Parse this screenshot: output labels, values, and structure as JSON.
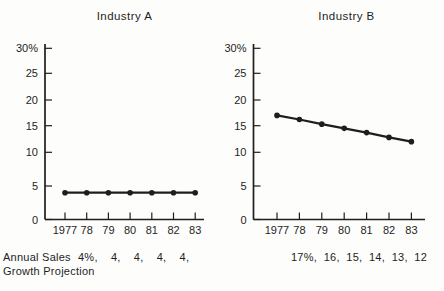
{
  "page": {
    "background": "#fdfdfb",
    "ink": "#1e1e1e"
  },
  "chart_data": [
    {
      "type": "line",
      "title": "Industry A",
      "categories": [
        "1977",
        "78",
        "79",
        "80",
        "81",
        "82",
        "83"
      ],
      "values": [
        4,
        4,
        4,
        4,
        4,
        4,
        4
      ],
      "y_tick_labels": [
        "30%",
        "25",
        "20",
        "15",
        "10",
        "5",
        "0"
      ],
      "y_tick_values": [
        30,
        25,
        20,
        15,
        10,
        5,
        0
      ],
      "ylim": [
        0,
        30
      ],
      "xlabel": "",
      "ylabel": "",
      "grid": false,
      "legend": false,
      "marker": "dot",
      "annotation_row": "4%,    4,    4,    4,    4,"
    },
    {
      "type": "line",
      "title": "Industry B",
      "categories": [
        "1977",
        "78",
        "79",
        "80",
        "81",
        "82",
        "83"
      ],
      "values": [
        17,
        16.2,
        15.3,
        14.5,
        13.7,
        12.8,
        12
      ],
      "y_tick_labels": [
        "30%",
        "25",
        "20",
        "15",
        "10",
        "5",
        "0"
      ],
      "y_tick_values": [
        30,
        25,
        20,
        15,
        10,
        5,
        0
      ],
      "ylim": [
        0,
        30
      ],
      "xlabel": "",
      "ylabel": "",
      "grid": false,
      "legend": false,
      "marker": "dot",
      "annotation_row": "17%,  16,  15,  14,  13,  12"
    }
  ],
  "caption": {
    "line1": "Annual Sales",
    "line2": "Growth Projection"
  }
}
